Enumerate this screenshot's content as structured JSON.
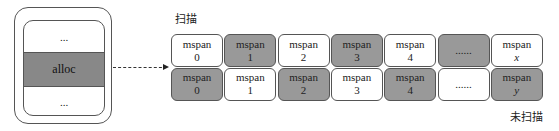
{
  "heap": {
    "top_label": "...",
    "alloc_label": "alloc",
    "bottom_label": "..."
  },
  "labels": {
    "scanned": "扫描",
    "unscanned": "未扫描"
  },
  "rows": [
    {
      "cells": [
        {
          "name": "mspan",
          "index": "0",
          "shaded": false
        },
        {
          "name": "mspan",
          "index": "1",
          "shaded": true
        },
        {
          "name": "mspan",
          "index": "2",
          "shaded": false
        },
        {
          "name": "mspan",
          "index": "3",
          "shaded": true
        },
        {
          "name": "mspan",
          "index": "4",
          "shaded": false
        },
        {
          "name": "",
          "index": "......",
          "shaded": true
        },
        {
          "name": "mspan",
          "index": "x",
          "shaded": false
        }
      ]
    },
    {
      "cells": [
        {
          "name": "mspan",
          "index": "0",
          "shaded": true
        },
        {
          "name": "mspan",
          "index": "1",
          "shaded": false
        },
        {
          "name": "mspan",
          "index": "2",
          "shaded": true
        },
        {
          "name": "mspan",
          "index": "3",
          "shaded": false
        },
        {
          "name": "mspan",
          "index": "4",
          "shaded": true
        },
        {
          "name": "",
          "index": "......",
          "shaded": false
        },
        {
          "name": "mspan",
          "index": "y",
          "shaded": true
        }
      ]
    }
  ],
  "colors": {
    "shaded": "#999999",
    "unshaded": "#ffffff",
    "border": "#555555"
  }
}
